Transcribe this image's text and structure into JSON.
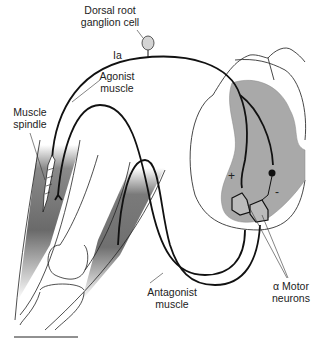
{
  "figure": {
    "type": "stretch reflex circuit diagram",
    "labels": {
      "dorsal_root_1": "Dorsal root",
      "dorsal_root_2": "ganglion cell",
      "ia": "Ia",
      "agonist_1": "Agonist",
      "agonist_2": "muscle",
      "spindle_1": "Muscle",
      "spindle_2": "spindle",
      "plus": "+",
      "minus": "-",
      "motor_1": "α Motor",
      "motor_2": "neurons",
      "antagonist_1": "Antagonist",
      "antagonist_2": "muscle"
    },
    "colors": {
      "line": "#111111",
      "gray_matter": "#a9a9a9",
      "muscle_dark": "#6e6e6e",
      "background": "#ffffff"
    }
  }
}
